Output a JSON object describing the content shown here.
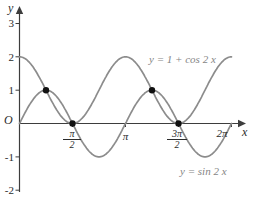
{
  "chart_data": {
    "type": "line",
    "title": "",
    "xlabel": "x",
    "ylabel": "y",
    "origin_label": "O",
    "x_domain_pi": [
      0,
      2
    ],
    "ylim": [
      -2,
      3
    ],
    "grid": false,
    "legend_position": "labels-on-curves",
    "x_pi": [
      0,
      0.25,
      0.5,
      0.75,
      1,
      1.25,
      1.5,
      1.75,
      2
    ],
    "series": [
      {
        "name": "y = 1 + cos 2 x",
        "expression": "1+cos(2x)",
        "values": [
          2,
          1,
          0,
          1,
          2,
          1,
          0,
          1,
          2
        ]
      },
      {
        "name": "y = sin 2 x",
        "expression": "sin(2x)",
        "values": [
          0,
          1,
          0,
          -1,
          0,
          1,
          0,
          -1,
          0
        ]
      }
    ],
    "intersections_pi": [
      [
        0.25,
        1
      ],
      [
        0.5,
        0
      ],
      [
        1.25,
        1
      ],
      [
        1.5,
        0
      ]
    ],
    "axes": {
      "y_ticks": [
        {
          "label": "3",
          "value": 3
        },
        {
          "label": "2",
          "value": 2
        },
        {
          "label": "1",
          "value": 1
        },
        {
          "label": "-1",
          "value": -1
        },
        {
          "label": "-2",
          "value": -2
        }
      ],
      "x_ticks": [
        {
          "label": "π/2",
          "num": "π",
          "den": "2",
          "value_pi": 0.5
        },
        {
          "label": "π",
          "value_pi": 1
        },
        {
          "label": "3π/2",
          "num": "3π",
          "den": "2",
          "value_pi": 1.5
        },
        {
          "label": "2π",
          "value_pi": 2
        }
      ]
    },
    "style": {
      "curve_color": "#8c8c8c",
      "axis_color": "#3d3d3d",
      "point_color": "#111111",
      "tick_label_color": "#2b2b2b",
      "equation_label_color": "#858585",
      "background_color": "#ffffff"
    }
  }
}
